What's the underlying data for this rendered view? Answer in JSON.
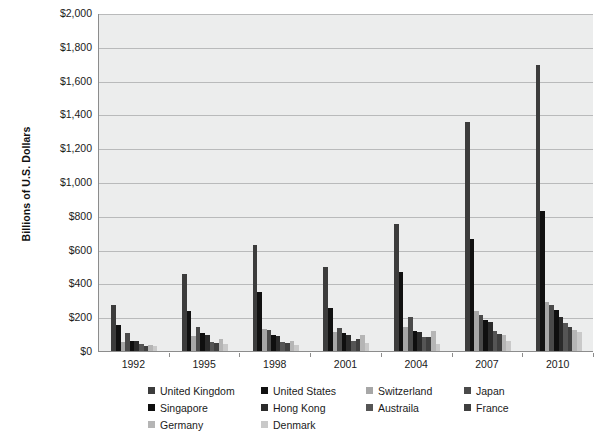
{
  "chart_data": {
    "type": "bar",
    "title": "",
    "xlabel": "",
    "ylabel": "Billions of U.S. Dollars",
    "ylim": [
      0,
      2000
    ],
    "ytick_step": 200,
    "ytick_labels": [
      "$0",
      "$200",
      "$400",
      "$600",
      "$800",
      "$1,000",
      "$1,200",
      "$1,400",
      "$1,600",
      "$1,800",
      "$2,000"
    ],
    "grid": true,
    "legend_position": "bottom",
    "categories": [
      "1992",
      "1995",
      "1998",
      "2001",
      "2004",
      "2007",
      "2010"
    ],
    "x_tick_labels": [
      "1992",
      "1995",
      "1998",
      "2001",
      "2004",
      "2007",
      "2010"
    ],
    "series": [
      {
        "name": "United Kingdom",
        "color": "#3c3c3c",
        "values": [
          275,
          455,
          630,
          500,
          750,
          1355,
          1690
        ]
      },
      {
        "name": "United States",
        "color": "#111111",
        "values": [
          155,
          235,
          350,
          255,
          465,
          660,
          830
        ]
      },
      {
        "name": "Switzerland",
        "color": "#a7a7a7",
        "values": [
          55,
          90,
          130,
          110,
          145,
          235,
          290
        ]
      },
      {
        "name": "Japan",
        "color": "#4a4a4a",
        "values": [
          105,
          140,
          125,
          135,
          200,
          215,
          270
        ]
      },
      {
        "name": "Singapore",
        "color": "#0f0f0f",
        "values": [
          60,
          105,
          95,
          105,
          120,
          185,
          245
        ]
      },
      {
        "name": "Hong Kong",
        "color": "#2b2b2b",
        "values": [
          62,
          95,
          90,
          95,
          115,
          170,
          200
        ]
      },
      {
        "name": "Austraila",
        "color": "#555555",
        "values": [
          40,
          55,
          55,
          60,
          80,
          120,
          165
        ]
      },
      {
        "name": "France",
        "color": "#3f3f3f",
        "values": [
          30,
          45,
          45,
          70,
          85,
          100,
          140
        ]
      },
      {
        "name": "Germany",
        "color": "#b5b5b5",
        "values": [
          35,
          70,
          60,
          95,
          120,
          95,
          125
        ]
      },
      {
        "name": "Denmark",
        "color": "#c9c9c9",
        "values": [
          28,
          40,
          35,
          45,
          40,
          60,
          115
        ]
      }
    ]
  },
  "legend": {
    "rows": [
      [
        {
          "label": "United Kingdom",
          "color": "#3c3c3c"
        },
        {
          "label": "United States",
          "color": "#111111"
        },
        {
          "label": "Switzerland",
          "color": "#a7a7a7"
        },
        {
          "label": "Japan",
          "color": "#4a4a4a"
        }
      ],
      [
        {
          "label": "Singapore",
          "color": "#0f0f0f"
        },
        {
          "label": "Hong Kong",
          "color": "#2b2b2b"
        },
        {
          "label": "Austraila",
          "color": "#555555"
        },
        {
          "label": "France",
          "color": "#3f3f3f"
        }
      ],
      [
        {
          "label": "Germany",
          "color": "#b5b5b5"
        },
        {
          "label": "Denmark",
          "color": "#c9c9c9"
        }
      ]
    ]
  },
  "style": {
    "plot_background": "#eceded",
    "grid_color": "#b9babb",
    "axis_color": "#8c8c8c",
    "text_color": "#1a1a1a"
  }
}
